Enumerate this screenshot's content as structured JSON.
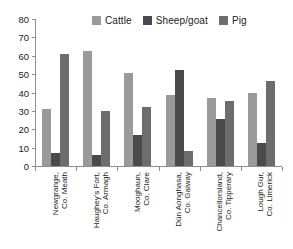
{
  "chart_data": {
    "type": "bar",
    "title": "",
    "subtitle": "",
    "xlabel": "",
    "ylabel": "",
    "ylim": [
      0,
      80
    ],
    "yticks": [
      0,
      10,
      20,
      30,
      40,
      50,
      60,
      70,
      80
    ],
    "grid": false,
    "legend_position": "top",
    "categories": [
      "Newgrange, Co. Meath",
      "Haughey's Fort, Co. Armagh",
      "Mooghaun, Co. Clare",
      "Dún Aonghasa, Co. Galway",
      "Chancellorsland, Co. Tipperary",
      "Lough Gur, Co. Limerick"
    ],
    "category_lines": [
      [
        "Newgrange,",
        "Co. Meath"
      ],
      [
        "Haughey's Fort,",
        "Co. Armagh"
      ],
      [
        "Mooghaun,",
        "Co. Clare"
      ],
      [
        "Dún Aonghasa,",
        "Co. Galway"
      ],
      [
        "Chancellorsland,",
        "Co. Tipperary"
      ],
      [
        "Lough Gur,",
        "Co. Limerick"
      ]
    ],
    "series": [
      {
        "name": "Cattle",
        "color": "#9a9a9a",
        "values": [
          31,
          62.5,
          50.5,
          38.5,
          37,
          39.5
        ]
      },
      {
        "name": "Sheep/goat",
        "color": "#4a4a4a",
        "values": [
          7,
          6,
          17,
          52,
          25.5,
          12.5
        ]
      },
      {
        "name": "Pig",
        "color": "#6d6d6d",
        "values": [
          61,
          30,
          32,
          8,
          35.5,
          46
        ]
      }
    ]
  },
  "axis": {
    "axis_color": "#8d8d8d",
    "text_color": "#1b1b1b"
  }
}
